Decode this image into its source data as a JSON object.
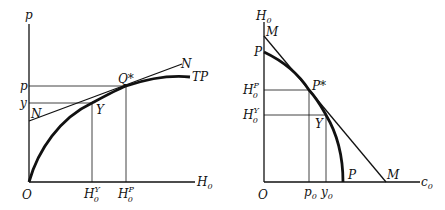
{
  "left_diagram": {
    "y_axis_label": "p",
    "x_axis_label": "H",
    "x_axis_label_sub": "0",
    "origin_label": "O",
    "p_tick": "p",
    "y_tick": "y",
    "curve_label": "TP",
    "tangent_label_top": "N",
    "tangent_label_bottom": "N",
    "tangent_point_label": "Q*",
    "point_y_label": "Y",
    "xtick_y": {
      "base": "H",
      "sub": "0",
      "sup": "Y"
    },
    "xtick_p": {
      "base": "H",
      "sub": "0",
      "sup": "P"
    }
  },
  "right_diagram": {
    "y_axis_label": "H",
    "y_axis_label_sub": "0",
    "x_axis_label": "c",
    "x_axis_label_sub": "0",
    "origin_label": "O",
    "line_label_top": "M",
    "line_label_bottom": "M",
    "curve_label_top": "P",
    "curve_label_bottom": "P",
    "tangent_point_label": "P*",
    "point_y_label": "Y",
    "ytick_p": {
      "base": "H",
      "sub": "0",
      "sup": "P"
    },
    "ytick_y": {
      "base": "H",
      "sub": "0",
      "sup": "Y"
    },
    "xtick_p": {
      "base": "p",
      "sub": "0"
    },
    "xtick_y": {
      "base": "y",
      "sub": "0"
    }
  }
}
